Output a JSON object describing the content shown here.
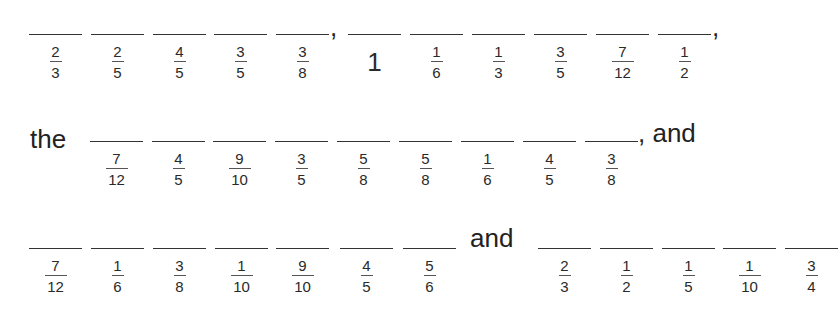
{
  "rows": [
    {
      "prefix": "",
      "groups": [
        {
          "items": [
            {
              "num": "2",
              "den": "3"
            },
            {
              "num": "2",
              "den": "5"
            },
            {
              "num": "4",
              "den": "5"
            },
            {
              "num": "3",
              "den": "5"
            },
            {
              "num": "3",
              "den": "8"
            }
          ],
          "suffix": ","
        },
        {
          "items": [
            {
              "whole": "1"
            },
            {
              "num": "1",
              "den": "6"
            },
            {
              "num": "1",
              "den": "3"
            },
            {
              "num": "3",
              "den": "5"
            },
            {
              "num": "7",
              "den": "12"
            },
            {
              "num": "1",
              "den": "2"
            }
          ],
          "suffix": ","
        }
      ]
    },
    {
      "prefix": "the",
      "groups": [
        {
          "items": [
            {
              "num": "7",
              "den": "12"
            },
            {
              "num": "4",
              "den": "5"
            },
            {
              "num": "9",
              "den": "10"
            },
            {
              "num": "3",
              "den": "5"
            },
            {
              "num": "5",
              "den": "8"
            },
            {
              "num": "5",
              "den": "8"
            },
            {
              "num": "1",
              "den": "6"
            },
            {
              "num": "4",
              "den": "5"
            },
            {
              "num": "3",
              "den": "8"
            }
          ],
          "suffix": ", and"
        }
      ]
    },
    {
      "prefix": "",
      "groups": [
        {
          "items": [
            {
              "num": "7",
              "den": "12"
            },
            {
              "num": "1",
              "den": "6"
            },
            {
              "num": "3",
              "den": "8"
            },
            {
              "num": "1",
              "den": "10"
            },
            {
              "num": "9",
              "den": "10"
            },
            {
              "num": "4",
              "den": "5"
            },
            {
              "num": "5",
              "den": "6"
            }
          ],
          "suffix": "and"
        },
        {
          "items": [
            {
              "num": "2",
              "den": "3"
            },
            {
              "num": "1",
              "den": "2"
            },
            {
              "num": "1",
              "den": "5"
            },
            {
              "num": "1",
              "den": "10"
            },
            {
              "num": "3",
              "den": "4"
            }
          ],
          "suffix": ""
        }
      ]
    }
  ]
}
